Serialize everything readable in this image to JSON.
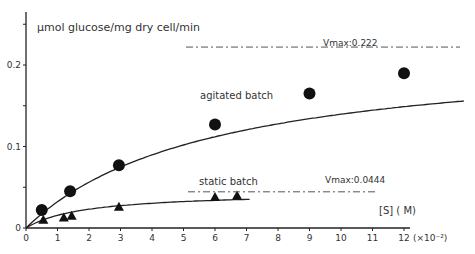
{
  "chart_data": {
    "type": "line",
    "title": "",
    "ylabel": "µmol glucose/mg dry cell/min",
    "xlabel": "[S] (M)",
    "x_multiplier": "(×10⁻²)",
    "xlim": [
      0,
      12.5
    ],
    "ylim": [
      0,
      0.25
    ],
    "x_ticks": [
      "0",
      "1",
      "2",
      "3",
      "4",
      "5",
      "6",
      "7",
      "8",
      "9",
      "10",
      "11",
      "12"
    ],
    "y_ticks": [
      "0",
      "0.1",
      "0.2"
    ],
    "y_minor_ticks": [
      0.05,
      0.15,
      0.25
    ],
    "grid": false,
    "series": [
      {
        "name": "agitated batch",
        "marker": "circle",
        "vmax": 0.222,
        "vmax_label": "Vmax: 0.222",
        "x": [
          0.5,
          1.4,
          2.95,
          6.0,
          9.0,
          12.0
        ],
        "y": [
          0.022,
          0.045,
          0.077,
          0.127,
          0.165,
          0.19
        ]
      },
      {
        "name": "static batch",
        "marker": "triangle",
        "vmax": 0.0444,
        "vmax_label": "Vmax: 0.0444",
        "x": [
          0.55,
          1.2,
          1.45,
          2.95,
          6.0,
          6.7
        ],
        "y": [
          0.01,
          0.013,
          0.015,
          0.026,
          0.038,
          0.04
        ]
      }
    ]
  },
  "labels": {
    "ylabel": "µmol glucose/mg dry cell/min",
    "agitated": "agitated  batch",
    "static": "static  batch",
    "vmax_agitated": "Vmax:0.222",
    "vmax_static": "Vmax:0.0444",
    "xlabel": "[S] ( M)",
    "x_multiplier": "(×10⁻²)"
  }
}
